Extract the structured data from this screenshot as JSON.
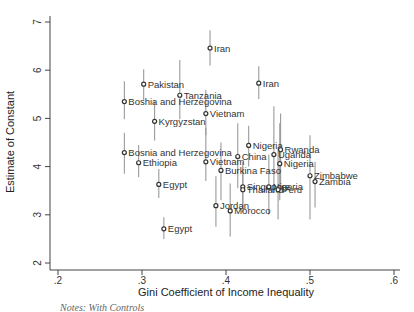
{
  "chart_data": {
    "type": "scatter",
    "title": "",
    "xlabel": "Gini Coefficient of Income Inequality",
    "ylabel": "Estimate of Constant",
    "xlim": [
      0.2,
      0.6
    ],
    "ylim": [
      2,
      7
    ],
    "xticks": [
      ".2",
      ".3",
      ".4",
      ".5",
      ".6"
    ],
    "yticks": [
      "2",
      "3",
      "4",
      "5",
      "6",
      "7"
    ],
    "grid": false,
    "legend": null,
    "error_bars": true,
    "points": [
      {
        "label": "Iran",
        "x": 0.381,
        "y": 6.46,
        "lo": 6.1,
        "hi": 6.83
      },
      {
        "label": "Iran",
        "x": 0.439,
        "y": 5.73,
        "lo": 5.4,
        "hi": 6.08
      },
      {
        "label": "Pakistan",
        "x": 0.302,
        "y": 5.71,
        "lo": 5.38,
        "hi": 6.02
      },
      {
        "label": "Tanzania",
        "x": 0.345,
        "y": 5.48,
        "lo": 4.98,
        "hi": 6.21
      },
      {
        "label": "Boshia and Herzegovina",
        "x": 0.279,
        "y": 5.35,
        "lo": 4.98,
        "hi": 5.77
      },
      {
        "label": "Vietnam",
        "x": 0.376,
        "y": 5.1,
        "lo": 4.65,
        "hi": 5.59
      },
      {
        "label": "Kyrgyzstan",
        "x": 0.315,
        "y": 4.94,
        "lo": 4.54,
        "hi": 5.35
      },
      {
        "label": "Nigeria",
        "x": 0.427,
        "y": 4.44,
        "lo": 4.0,
        "hi": 4.85
      },
      {
        "label": "Rwanda",
        "x": 0.465,
        "y": 4.35,
        "lo": 3.6,
        "hi": 5.1
      },
      {
        "label": "Bosnia and Herzegovina",
        "x": 0.279,
        "y": 4.29,
        "lo": 3.85,
        "hi": 4.7
      },
      {
        "label": "Uganda",
        "x": 0.457,
        "y": 4.25,
        "lo": 3.45,
        "hi": 5.25
      },
      {
        "label": "China",
        "x": 0.414,
        "y": 4.21,
        "lo": 3.55,
        "hi": 4.9
      },
      {
        "label": "Vietnam",
        "x": 0.376,
        "y": 4.1,
        "lo": 3.7,
        "hi": 4.8
      },
      {
        "label": "Ethiopia",
        "x": 0.296,
        "y": 4.08,
        "lo": 3.78,
        "hi": 4.45
      },
      {
        "label": "Nigeria",
        "x": 0.464,
        "y": 4.06,
        "lo": 3.3,
        "hi": 4.9
      },
      {
        "label": "Burkina Faso",
        "x": 0.394,
        "y": 3.92,
        "lo": 3.3,
        "hi": 4.5
      },
      {
        "label": "Zimbabwe",
        "x": 0.5,
        "y": 3.81,
        "lo": 2.9,
        "hi": 4.65
      },
      {
        "label": "Zambia",
        "x": 0.506,
        "y": 3.69,
        "lo": 3.15,
        "hi": 4.1
      },
      {
        "label": "Egypt",
        "x": 0.32,
        "y": 3.63,
        "lo": 3.35,
        "hi": 3.95
      },
      {
        "label": "Singapore",
        "x": 0.42,
        "y": 3.58,
        "lo": 3.15,
        "hi": 4.1
      },
      {
        "label": "Nigeria",
        "x": 0.451,
        "y": 3.58,
        "lo": 3.0,
        "hi": 4.25
      },
      {
        "label": "Thailand",
        "x": 0.42,
        "y": 3.52,
        "lo": 3.05,
        "hi": 4.0
      },
      {
        "label": "Peru",
        "x": 0.462,
        "y": 3.52,
        "lo": 2.9,
        "hi": 4.4
      },
      {
        "label": "Jordan",
        "x": 0.388,
        "y": 3.19,
        "lo": 2.75,
        "hi": 3.8
      },
      {
        "label": "Morocco",
        "x": 0.405,
        "y": 3.08,
        "lo": 2.55,
        "hi": 3.65
      },
      {
        "label": "Egypt",
        "x": 0.326,
        "y": 2.71,
        "lo": 2.5,
        "hi": 2.95
      }
    ]
  },
  "caption": "Notes: With Controls"
}
